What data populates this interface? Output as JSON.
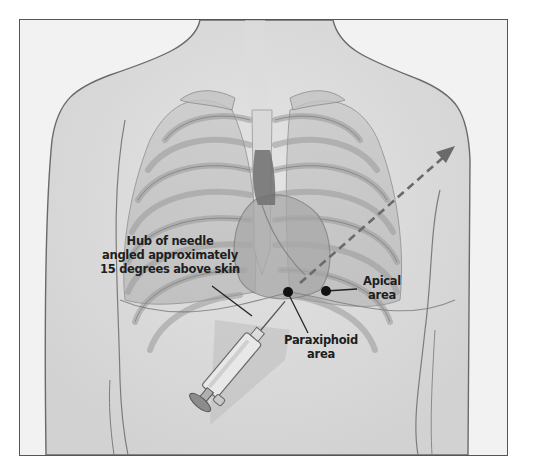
{
  "figure": {
    "frame_color": "#555555",
    "background_color": "#f3f3f3"
  },
  "annotations": {
    "hub": {
      "lines": [
        "Hub of needle",
        "angled approximately",
        "15 degrees above skin"
      ]
    },
    "paraxiphoid": {
      "lines": [
        "Paraxiphoid",
        "area"
      ]
    },
    "apical": {
      "lines": [
        "Apical",
        "area"
      ]
    }
  },
  "markers": {
    "paraxiphoid_point": {
      "x": 288,
      "y": 292
    },
    "apical_point": {
      "x": 326,
      "y": 291
    },
    "dot_color": "#111111"
  },
  "arrow": {
    "style": "dashed",
    "from": {
      "x": 300,
      "y": 283
    },
    "to": {
      "x": 453,
      "y": 148
    },
    "color": "#6a6a6a"
  },
  "icons": {
    "syringe": "syringe-icon",
    "heart": "heart-illustration",
    "ribcage": "ribcage-illustration"
  }
}
